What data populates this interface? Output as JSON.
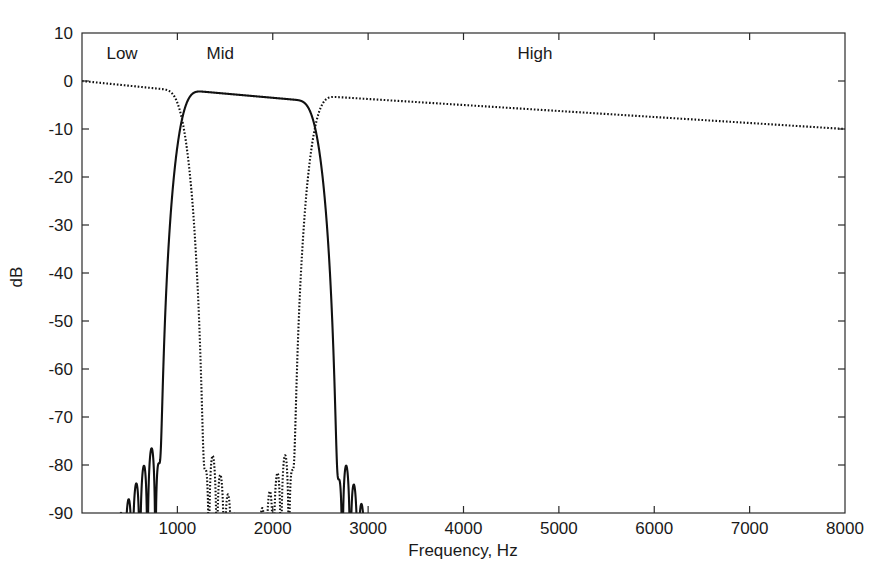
{
  "chart_data": {
    "type": "line",
    "title": "",
    "xlabel": "Frequency, Hz",
    "ylabel": "dB",
    "xlim": [
      0,
      8000
    ],
    "ylim": [
      -90,
      10
    ],
    "grid": false,
    "legend_position": "inline-annotations",
    "xticks": [
      0,
      1000,
      2000,
      3000,
      4000,
      5000,
      6000,
      7000,
      8000
    ],
    "xtick_labels": [
      "",
      "1000",
      "2000",
      "3000",
      "4000",
      "5000",
      "6000",
      "7000",
      "8000"
    ],
    "yticks": [
      10,
      0,
      -10,
      -20,
      -30,
      -40,
      -50,
      -60,
      -70,
      -80,
      -90
    ],
    "ytick_labels": [
      "10",
      "0",
      "-10",
      "-20",
      "-30",
      "-40",
      "-50",
      "-60",
      "-70",
      "-80",
      "-90"
    ],
    "annotations": [
      {
        "text": "Low",
        "x": 420,
        "y": 4.5
      },
      {
        "text": "Mid",
        "x": 1450,
        "y": 4.5
      },
      {
        "text": "High",
        "x": 4750,
        "y": 4.5
      }
    ],
    "series": [
      {
        "name": "Low",
        "style": "dotted",
        "description": "Lowpass filter magnitude response, passband 0 to ~900 Hz at 0 dB, transition crossing -6 dB near 1000 Hz, stopband ripples decaying from about -60 dB near 1200 Hz toward -85 dB at 8000 Hz",
        "passband_db": 0,
        "cutoff_hz": 1000,
        "stopband_start_db": -60,
        "stopband_end_db": -85
      },
      {
        "name": "Mid",
        "style": "solid",
        "description": "Bandpass filter magnitude response, passband ~1150 to ~2300 Hz at 0 dB, lower transition crossing -6 dB near 1000 Hz, upper transition crossing -6 dB near 2400 Hz, stopband ripples near -60 dB below 900 Hz and decaying from -62 dB at 3000 Hz to -78 dB at 8000 Hz",
        "passband_db": 0,
        "low_cutoff_hz": 1000,
        "high_cutoff_hz": 2400,
        "stopband_db": -62
      },
      {
        "name": "High",
        "style": "dotted",
        "description": "Highpass filter magnitude response, stopband below 2300 Hz, transition crossing -6 dB near 2400 Hz, passband ~2600 to 8000 Hz at 0 dB",
        "passband_db": 0,
        "cutoff_hz": 2400
      }
    ]
  }
}
